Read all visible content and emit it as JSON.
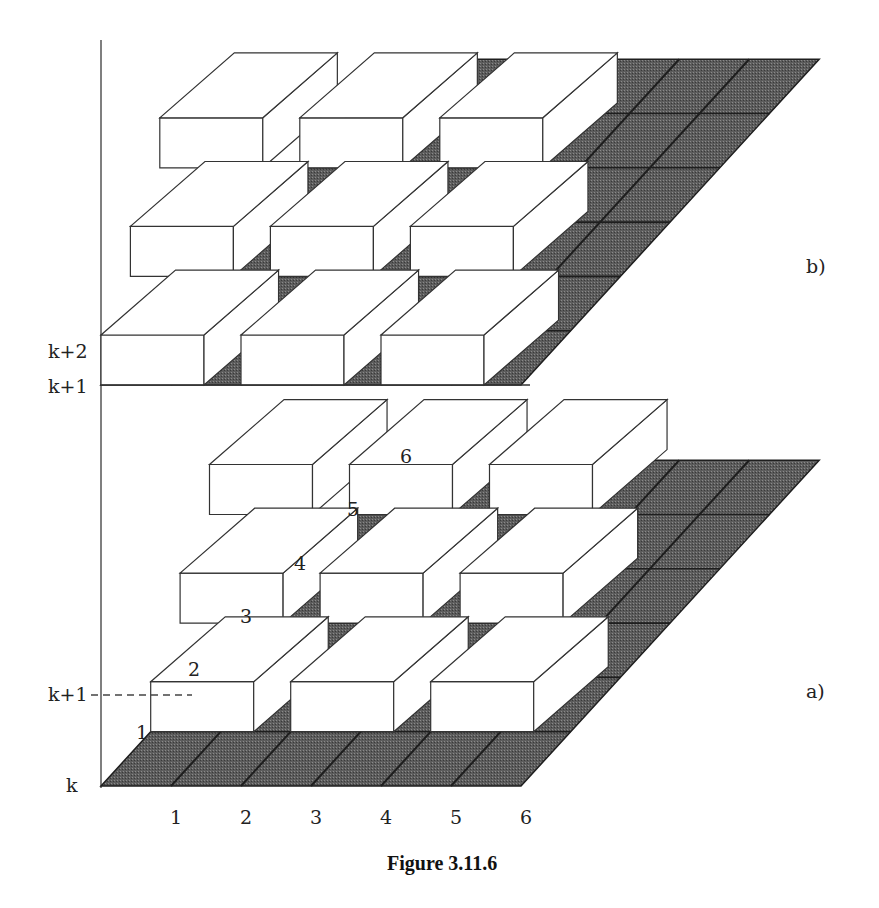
{
  "figure": {
    "caption": "Figure 3.11.6",
    "colors": {
      "grid_fill": "#5a5a5a",
      "grid_fill_light": "#6e6e6e",
      "grid_line": "#1e1e1e",
      "block_fill": "#ffffff",
      "block_stroke": "#333333",
      "axis": "#555555"
    }
  },
  "panel_b": {
    "label": "b)",
    "y_labels": [
      "k+2",
      "k+1"
    ],
    "blocks": [
      {
        "row": 1,
        "col": 1
      },
      {
        "row": 1,
        "col": 3
      },
      {
        "row": 1,
        "col": 5
      },
      {
        "row": 3,
        "col": 2
      },
      {
        "row": 3,
        "col": 4
      },
      {
        "row": 3,
        "col": 6
      },
      {
        "row": 5,
        "col": 3
      },
      {
        "row": 5,
        "col": 5
      },
      {
        "row": 5,
        "col": 7
      }
    ]
  },
  "panel_a": {
    "label": "a)",
    "y_labels": [
      "k+1",
      "k"
    ],
    "row_labels": [
      "1",
      "2",
      "3",
      "4",
      "5",
      "6"
    ],
    "x_labels": [
      "1",
      "2",
      "3",
      "4",
      "5",
      "6"
    ],
    "blocks": [
      {
        "row": 2,
        "col": 2
      },
      {
        "row": 2,
        "col": 4
      },
      {
        "row": 2,
        "col": 6
      },
      {
        "row": 4,
        "col": 3
      },
      {
        "row": 4,
        "col": 5
      },
      {
        "row": 4,
        "col": 7
      },
      {
        "row": 6,
        "col": 4
      },
      {
        "row": 6,
        "col": 6
      },
      {
        "row": 6,
        "col": 8
      }
    ]
  }
}
